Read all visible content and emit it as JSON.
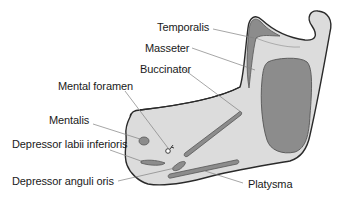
{
  "diagram": {
    "colors": {
      "bone_fill": "#dcdcdc",
      "bone_outline": "#2a2a2a",
      "muscle_fill": "#8c8c8c",
      "muscle_outline": "#555555",
      "leader_line": "#808080",
      "text": "#1a1a1a"
    },
    "labels": [
      {
        "id": "temporalis",
        "text": "Temporalis"
      },
      {
        "id": "masseter",
        "text": "Masseter"
      },
      {
        "id": "buccinator",
        "text": "Buccinator"
      },
      {
        "id": "mental-foramen",
        "text": "Mental foramen"
      },
      {
        "id": "mentalis",
        "text": "Mentalis"
      },
      {
        "id": "depressor-labii-inferioris",
        "text": "Depressor labii inferioris"
      },
      {
        "id": "depressor-anguli-oris",
        "text": "Depressor anguli oris"
      },
      {
        "id": "platysma",
        "text": "Platysma"
      }
    ]
  }
}
